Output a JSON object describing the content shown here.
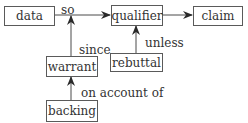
{
  "diagram": {
    "type": "toulmin-argument-model",
    "nodes": {
      "data": "data",
      "qualifier": "qualifier",
      "claim": "claim",
      "warrant": "warrant",
      "rebuttal": "rebuttal",
      "backing": "backing"
    },
    "edge_labels": {
      "so": "so",
      "since": "since",
      "unless": "unless",
      "on_account_of": "on account of"
    },
    "edges": [
      {
        "from": "data",
        "to": "qualifier",
        "label": "so"
      },
      {
        "from": "qualifier",
        "to": "claim",
        "label": ""
      },
      {
        "from": "warrant",
        "to": "data-qualifier-link",
        "label": "since"
      },
      {
        "from": "rebuttal",
        "to": "qualifier",
        "label": "unless"
      },
      {
        "from": "backing",
        "to": "warrant",
        "label": "on account of"
      }
    ],
    "colors": {
      "line": "#4a4a4a",
      "box_border": "#5a5a5a",
      "text": "#333333"
    }
  }
}
